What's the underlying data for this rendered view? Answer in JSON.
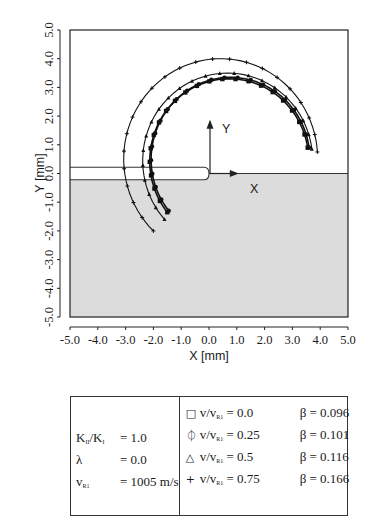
{
  "chart_data": {
    "type": "line",
    "title": "",
    "xlabel": "X  [mm]",
    "ylabel": "Y  [mm]",
    "xlim": [
      -5.0,
      5.0
    ],
    "ylim": [
      -5.0,
      5.0
    ],
    "x_ticks": [
      "-5.0",
      "-4.0",
      "-3.0",
      "-2.0",
      "-1.0",
      "0.0",
      "1.0",
      "2.0",
      "3.0",
      "4.0",
      "5.0"
    ],
    "y_ticks": [
      "-5.0",
      "-4.0",
      "-3.0",
      "-2.0",
      "-1.0",
      "0.0",
      "1.0",
      "2.0",
      "3.0",
      "4.0",
      "5.0"
    ],
    "grid": false,
    "annotations": {
      "local_x_axis": "X",
      "local_y_axis": "Y",
      "notch_from_x": -5.0,
      "notch_to_x": 0.0,
      "notch_half_width": 0.22,
      "shaded_region": "y < 0 (specimen half-space)"
    },
    "series": [
      {
        "name": "v/vR1 = 0.0  β = 0.096",
        "marker": "square",
        "start": [
          -1.5,
          -1.35
        ],
        "apex": [
          0.7,
          3.3
        ],
        "end": [
          3.55,
          0.9
        ]
      },
      {
        "name": "v/vR1 = 0.25 β = 0.101",
        "marker": "circle",
        "start": [
          -1.45,
          -1.3
        ],
        "apex": [
          0.75,
          3.35
        ],
        "end": [
          3.6,
          0.9
        ]
      },
      {
        "name": "v/vR1 = 0.5  β = 0.116",
        "marker": "triangle",
        "start": [
          -1.6,
          -1.6
        ],
        "apex": [
          0.7,
          3.5
        ],
        "end": [
          3.7,
          0.85
        ]
      },
      {
        "name": "v/vR1 = 0.75 β = 0.166",
        "marker": "plus",
        "start": [
          -2.0,
          -2.0
        ],
        "apex": [
          0.4,
          4.0
        ],
        "end": [
          3.9,
          0.75
        ]
      }
    ]
  },
  "legend": {
    "params": [
      {
        "name": "K",
        "sub1": "II",
        "slash": "/K",
        "sub2": "I",
        "value": "= 1.0"
      },
      {
        "name": "λ",
        "value": "= 0.0"
      },
      {
        "name": "v",
        "sub1": "R1",
        "value": "= 1005  m/s"
      }
    ],
    "series": [
      {
        "marker": "□",
        "label_v": "v/v",
        "label_sub": "R1",
        "label_val": " = 0.0",
        "beta": "β = 0.096"
      },
      {
        "marker": "⏀",
        "label_v": "v/v",
        "label_sub": "R1",
        "label_val": " = 0.25",
        "beta": "β = 0.101"
      },
      {
        "marker": "△",
        "label_v": "v/v",
        "label_sub": "R1",
        "label_val": " = 0.5",
        "beta": "β = 0.116"
      },
      {
        "marker": "+",
        "label_v": "v/v",
        "label_sub": "R1",
        "label_val": " = 0.75",
        "beta": "β = 0.166"
      }
    ]
  }
}
